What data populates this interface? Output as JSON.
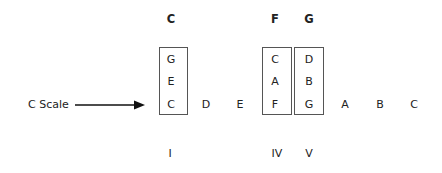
{
  "diagram": {
    "scale_label": "C Scale",
    "headers": {
      "c": "C",
      "f": "F",
      "g": "G"
    },
    "chords": {
      "c": {
        "top": "G",
        "mid": "E",
        "root": "C"
      },
      "f": {
        "top": "C",
        "mid": "A",
        "root": "F"
      },
      "g": {
        "top": "D",
        "mid": "B",
        "root": "G"
      }
    },
    "scale_notes": [
      "C",
      "D",
      "E",
      "F",
      "G",
      "A",
      "B",
      "C"
    ],
    "roman_numerals": {
      "c": "I",
      "f": "IV",
      "g": "V"
    },
    "colors": {
      "text": "#222222",
      "box_border": "#555555",
      "arrow": "#111111"
    }
  }
}
